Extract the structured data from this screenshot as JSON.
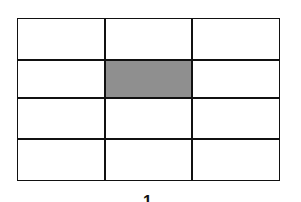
{
  "diagram": {
    "rows": 4,
    "columns": 3,
    "highlighted_cell": {
      "row": 2,
      "column": 2,
      "color": "#8f8f8f"
    },
    "line_color": "#111111",
    "caption": "1"
  }
}
